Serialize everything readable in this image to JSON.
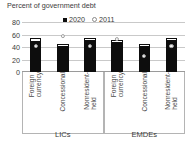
{
  "chart_data": {
    "type": "bar",
    "title": "Percent of government debt",
    "xlabel": "",
    "ylabel": "",
    "ylim": [
      0,
      80
    ],
    "yticks": [
      0,
      20,
      40,
      60,
      80
    ],
    "grid": true,
    "legend_position": "top-center",
    "legend": [
      {
        "name": "2020",
        "marker": "square",
        "color": "#0d0d0d"
      },
      {
        "name": "2011",
        "marker": "dot",
        "color": "#ffffff"
      }
    ],
    "groups": [
      {
        "name": "LICs",
        "categories": [
          "Foreign\ncurrency",
          "Concessional",
          "Nonresident-\nheld"
        ],
        "series": [
          {
            "name": "2020",
            "values": [
              54,
              45,
              55
            ]
          },
          {
            "name": "2011",
            "values": [
              41,
              57,
              42
            ]
          }
        ]
      },
      {
        "name": "EMDEs",
        "categories": [
          "Foreign\ncurrency",
          "Concessional",
          "Nonresident-\nheld"
        ],
        "series": [
          {
            "name": "2020",
            "values": [
              52,
              45,
              55
            ]
          },
          {
            "name": "2011",
            "values": [
              53,
              25,
              42
            ]
          }
        ]
      }
    ]
  },
  "figure": {
    "title": "Percent of government debt",
    "legend_2020": "2020",
    "legend_2011": "2011",
    "ytick_80": "80",
    "ytick_60": "60",
    "ytick_40": "40",
    "ytick_20": "20",
    "ytick_0": "0",
    "cat_lics_1": "Foreign\ncurrency",
    "cat_lics_2": "Concessional",
    "cat_lics_3": "Nonresident-\nheld",
    "cat_emdes_1": "Foreign\ncurrency",
    "cat_emdes_2": "Concessional",
    "cat_emdes_3": "Nonresident-\nheld",
    "group_lics": "LICs",
    "group_emdes": "EMDEs"
  }
}
